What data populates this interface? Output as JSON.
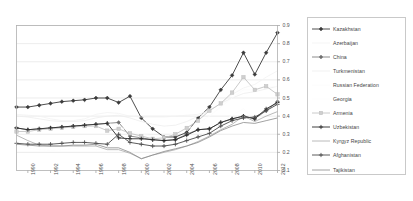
{
  "chart": {
    "title": "",
    "type": "line",
    "plot_background": "#ffffff",
    "border_color": "#b0b0b0",
    "gridline_color": "#e4e4e4"
  },
  "legend": {
    "position": "right",
    "entries": [
      {
        "label": "Kazakhstan",
        "color": "#3a3a3a",
        "marker": "diamond",
        "marker_fill": "#3a3a3a",
        "line": "solid",
        "width": 0.9
      },
      {
        "label": "Azerbaijan",
        "color": "#f2f2f2",
        "marker": "none",
        "marker_fill": "#f2f2f2",
        "line": "solid",
        "width": 0.8
      },
      {
        "label": "China",
        "color": "#707070",
        "marker": "diamond",
        "marker_fill": "#707070",
        "line": "solid",
        "width": 0.8
      },
      {
        "label": "Turkmenistan",
        "color": "#ededed",
        "marker": "none",
        "marker_fill": "#ededed",
        "line": "solid",
        "width": 0.8
      },
      {
        "label": "Russian Federation",
        "color": "#fbfbfb",
        "marker": "none",
        "marker_fill": "#fbfbfb",
        "line": "solid",
        "width": 0.8
      },
      {
        "label": "Georgia",
        "color": "#fdfdfd",
        "marker": "none",
        "marker_fill": "#fdfdfd",
        "line": "solid",
        "width": 0.8
      },
      {
        "label": "Armenia",
        "color": "#bdbdbd",
        "marker": "square",
        "marker_fill": "#cfcfcf",
        "line": "solid",
        "width": 0.8
      },
      {
        "label": "Uzbekistan",
        "color": "#2b2b2b",
        "marker": "plus",
        "marker_fill": "#2b2b2b",
        "line": "solid",
        "width": 0.9
      },
      {
        "label": "Kyrgyz Republic",
        "color": "#a8a8a8",
        "marker": "none",
        "marker_fill": "#a8a8a8",
        "line": "solid",
        "width": 0.8
      },
      {
        "label": "Afghanistan",
        "color": "#4a4a4a",
        "marker": "plus",
        "marker_fill": "#4a4a4a",
        "line": "solid",
        "width": 0.9
      },
      {
        "label": "Tajikistan",
        "color": "#8a8a8a",
        "marker": "none",
        "marker_fill": "#8a8a8a",
        "line": "solid",
        "width": 0.8
      }
    ]
  },
  "chart_data": {
    "type": "line",
    "title": "",
    "xlabel": "",
    "ylabel": "",
    "xlim": [
      1989,
      2012
    ],
    "ylim": [
      0.1,
      0.9
    ],
    "grid": true,
    "legend_position": "right",
    "x": [
      1989,
      1990,
      1991,
      1992,
      1993,
      1994,
      1995,
      1996,
      1997,
      1998,
      1999,
      2000,
      2001,
      2002,
      2003,
      2004,
      2005,
      2006,
      2007,
      2008,
      2009,
      2010,
      2011,
      2012
    ],
    "xticks": [
      1990,
      1992,
      1994,
      1996,
      1998,
      2000,
      2002,
      2004,
      2006,
      2008,
      2010,
      2012
    ],
    "yticks": [
      0.1,
      0.2,
      0.3,
      0.4,
      0.5,
      0.6,
      0.7,
      0.8,
      0.9
    ],
    "series": [
      {
        "name": "Kazakhstan",
        "values": [
          0.45,
          0.45,
          0.46,
          0.47,
          0.48,
          0.485,
          0.49,
          0.5,
          0.5,
          0.475,
          0.51,
          0.39,
          0.33,
          0.285,
          0.285,
          0.31,
          0.39,
          0.45,
          0.545,
          0.625,
          0.75,
          0.63,
          0.75,
          0.86
        ]
      },
      {
        "name": "Azerbaijan",
        "values": [
          0.41,
          0.405,
          0.4,
          0.385,
          0.375,
          0.375,
          0.385,
          0.41,
          0.42,
          0.415,
          0.4,
          0.395,
          0.395,
          0.395,
          0.4,
          0.405,
          0.41,
          0.43,
          0.47,
          0.52,
          0.555,
          0.575,
          0.615,
          0.65
        ]
      },
      {
        "name": "China",
        "values": [
          0.335,
          0.325,
          0.33,
          0.335,
          0.34,
          0.345,
          0.35,
          0.355,
          0.36,
          0.365,
          0.29,
          0.28,
          0.27,
          0.265,
          0.27,
          0.3,
          0.325,
          0.33,
          0.365,
          0.385,
          0.4,
          0.385,
          0.43,
          0.48
        ]
      },
      {
        "name": "Turkmenistan",
        "values": [
          0.4,
          0.395,
          0.385,
          0.375,
          0.37,
          0.37,
          0.375,
          0.39,
          0.4,
          0.405,
          0.39,
          0.37,
          0.355,
          0.345,
          0.35,
          0.37,
          0.4,
          0.43,
          0.47,
          0.5,
          0.525,
          0.535,
          0.55,
          0.565
        ]
      },
      {
        "name": "Russian Federation",
        "values": [
          0.345,
          0.34,
          0.335,
          0.33,
          0.335,
          0.34,
          0.345,
          0.355,
          0.36,
          0.345,
          0.315,
          0.3,
          0.29,
          0.29,
          0.3,
          0.325,
          0.36,
          0.4,
          0.45,
          0.5,
          0.545,
          0.545,
          0.56,
          0.565
        ]
      },
      {
        "name": "Georgia",
        "values": [
          0.255,
          0.225,
          0.215,
          0.21,
          0.215,
          0.22,
          0.23,
          0.215,
          0.22,
          0.225,
          0.2,
          0.19,
          0.19,
          0.2,
          0.215,
          0.245,
          0.285,
          0.315,
          0.365,
          0.405,
          0.44,
          0.385,
          0.41,
          0.425
        ]
      },
      {
        "name": "Armenia",
        "values": [
          0.315,
          0.315,
          0.325,
          0.33,
          0.335,
          0.34,
          0.345,
          0.345,
          0.32,
          0.33,
          0.305,
          0.29,
          0.275,
          0.28,
          0.3,
          0.335,
          0.375,
          0.43,
          0.47,
          0.53,
          0.615,
          0.545,
          0.565,
          0.52
        ]
      },
      {
        "name": "Uzbekistan",
        "values": [
          0.335,
          0.325,
          0.33,
          0.335,
          0.34,
          0.345,
          0.35,
          0.355,
          0.36,
          0.28,
          0.275,
          0.275,
          0.27,
          0.265,
          0.27,
          0.295,
          0.325,
          0.33,
          0.365,
          0.385,
          0.4,
          0.385,
          0.44,
          0.475
        ]
      },
      {
        "name": "Kyrgyz Republic",
        "values": [
          0.295,
          0.265,
          0.24,
          0.235,
          0.235,
          0.235,
          0.235,
          0.235,
          0.215,
          0.215,
          0.195,
          0.165,
          0.185,
          0.2,
          0.215,
          0.235,
          0.26,
          0.29,
          0.325,
          0.355,
          0.4,
          0.37,
          0.4,
          0.425
        ]
      },
      {
        "name": "Afghanistan",
        "values": [
          0.25,
          0.245,
          0.245,
          0.245,
          0.25,
          0.255,
          0.255,
          0.25,
          0.245,
          0.3,
          0.255,
          0.245,
          0.235,
          0.235,
          0.245,
          0.265,
          0.285,
          0.305,
          0.345,
          0.375,
          0.39,
          0.395,
          0.43,
          0.465
        ]
      },
      {
        "name": "Tajikistan",
        "values": [
          0.245,
          0.24,
          0.235,
          0.235,
          0.235,
          0.24,
          0.24,
          0.245,
          0.225,
          0.225,
          0.2,
          0.165,
          0.185,
          0.205,
          0.22,
          0.235,
          0.255,
          0.285,
          0.32,
          0.345,
          0.365,
          0.36,
          0.375,
          0.39
        ]
      }
    ]
  }
}
